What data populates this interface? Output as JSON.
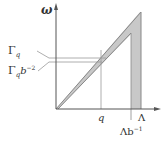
{
  "diagram": {
    "y_axis_label": "ω",
    "x_axis_labels": {
      "q": "q",
      "lambda": "Λ",
      "lambda_b_inv_main": "Λb",
      "lambda_b_inv_sup": "−1"
    },
    "y_axis_labels": {
      "gamma_q_main": "Γ",
      "gamma_q_sub": "q",
      "gamma_q_b_main": "Γ",
      "gamma_q_b_sub": "q",
      "gamma_q_b_b": "b",
      "gamma_q_b_sup": "−2"
    },
    "colors": {
      "axis": "#555555",
      "shade": "#c8c8c8",
      "line": "#888888"
    }
  }
}
